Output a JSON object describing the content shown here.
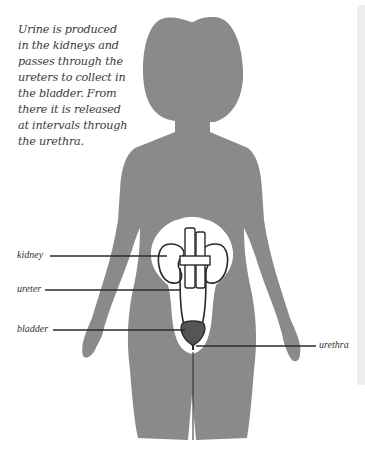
{
  "caption": {
    "lines": [
      "Urine is produced",
      "in the kidneys and",
      "passes through the",
      "ureters to collect in",
      "the bladder. From",
      "there it is released",
      "at intervals through",
      "the urethra."
    ]
  },
  "labels": {
    "kidney": "kidney",
    "ureter": "ureter",
    "bladder": "bladder",
    "urethra": "urethra"
  },
  "colors": {
    "silhouette": "#8a8a8a",
    "outline": "#2a2a2a",
    "bladder_fill": "#555555",
    "background": "#ffffff"
  }
}
